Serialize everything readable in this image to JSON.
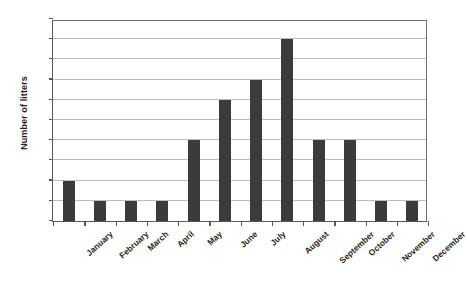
{
  "chart_data": {
    "type": "bar",
    "title": "",
    "xlabel": "",
    "ylabel": "Number of litters",
    "categories": [
      "January",
      "February",
      "March",
      "April",
      "May",
      "June",
      "July",
      "August",
      "September",
      "October",
      "November",
      "December"
    ],
    "values": [
      2,
      1,
      1,
      1,
      4,
      6,
      7,
      9,
      4,
      4,
      1,
      1
    ],
    "ylim": [
      0,
      10
    ],
    "yticks": [
      0,
      1,
      2,
      3,
      4,
      5,
      6,
      7,
      8,
      9,
      10
    ],
    "ytick_labels": [
      "0",
      "1",
      "2",
      "3",
      "4",
      "5",
      "6",
      "7",
      "8",
      "9",
      "10"
    ],
    "grid": true,
    "legend": false,
    "bar_color": "#3b3b3b",
    "grid_color": "#bcbcbc",
    "axis_color": "#58585a",
    "background": "#ffffff"
  }
}
